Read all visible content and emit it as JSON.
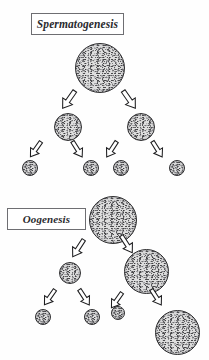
{
  "figure": {
    "title": "",
    "background_color": "#fefefe",
    "width": 209,
    "height": 360
  },
  "panels": [
    {
      "id": "spermatogenesis",
      "label": "Spermatogenesis",
      "label_box": {
        "x": 31,
        "y": 13,
        "w": 93,
        "h": 22,
        "border_color": "#6e6e72"
      },
      "cells": [
        {
          "id": "sperm-primary",
          "name": "primary-spermatocyte",
          "x": 75,
          "y": 43,
          "d": 50,
          "generation": 1
        },
        {
          "id": "sperm-sec-left",
          "name": "secondary-spermatocyte-left",
          "x": 54,
          "y": 113,
          "d": 28,
          "generation": 2
        },
        {
          "id": "sperm-sec-right",
          "name": "secondary-spermatocyte-right",
          "x": 127,
          "y": 113,
          "d": 28,
          "generation": 2
        },
        {
          "id": "sperm-tid-1",
          "name": "spermatid-1",
          "x": 22,
          "y": 160,
          "d": 16,
          "generation": 3
        },
        {
          "id": "sperm-tid-2",
          "name": "spermatid-2",
          "x": 83,
          "y": 160,
          "d": 16,
          "generation": 3
        },
        {
          "id": "sperm-tid-3",
          "name": "spermatid-3",
          "x": 113,
          "y": 160,
          "d": 16,
          "generation": 3
        },
        {
          "id": "sperm-tid-4",
          "name": "spermatid-4",
          "x": 169,
          "y": 160,
          "d": 16,
          "generation": 3
        }
      ],
      "arrows": [
        {
          "id": "sperm-a1",
          "x": 62,
          "y": 89,
          "len": 22,
          "w": 13,
          "angle": 35,
          "from": "sperm-primary",
          "to": "sperm-sec-left"
        },
        {
          "id": "sperm-a2",
          "x": 123,
          "y": 89,
          "len": 22,
          "w": 13,
          "angle": 145,
          "from": "sperm-primary",
          "to": "sperm-sec-right"
        },
        {
          "id": "sperm-a3",
          "x": 30,
          "y": 140,
          "len": 19,
          "w": 11,
          "angle": 35,
          "from": "sperm-sec-left",
          "to": "sperm-tid-1"
        },
        {
          "id": "sperm-a4",
          "x": 72,
          "y": 140,
          "len": 19,
          "w": 11,
          "angle": 148,
          "from": "sperm-sec-left",
          "to": "sperm-tid-2"
        },
        {
          "id": "sperm-a5",
          "x": 106,
          "y": 140,
          "len": 19,
          "w": 11,
          "angle": 33,
          "from": "sperm-sec-right",
          "to": "sperm-tid-3"
        },
        {
          "id": "sperm-a6",
          "x": 152,
          "y": 140,
          "len": 19,
          "w": 11,
          "angle": 148,
          "from": "sperm-sec-right",
          "to": "sperm-tid-4"
        }
      ]
    },
    {
      "id": "oogenesis",
      "label": "Oogenesis",
      "label_box": {
        "x": 7,
        "y": 208,
        "w": 79,
        "h": 22,
        "border_color": "#6e6e72"
      },
      "cells": [
        {
          "id": "oo-primary",
          "name": "primary-oocyte",
          "x": 89,
          "y": 196,
          "d": 48,
          "generation": 1
        },
        {
          "id": "oo-polar-1",
          "name": "first-polar-body",
          "x": 59,
          "y": 262,
          "d": 22,
          "generation": 2
        },
        {
          "id": "oo-secondary",
          "name": "secondary-oocyte",
          "x": 124,
          "y": 249,
          "d": 45,
          "generation": 2
        },
        {
          "id": "oo-polar-1a",
          "name": "polar-body-1a",
          "x": 35,
          "y": 309,
          "d": 16,
          "generation": 3
        },
        {
          "id": "oo-polar-1b",
          "name": "polar-body-1b",
          "x": 84,
          "y": 309,
          "d": 16,
          "generation": 3
        },
        {
          "id": "oo-polar-2",
          "name": "second-polar-body",
          "x": 111,
          "y": 306,
          "d": 14,
          "generation": 3
        },
        {
          "id": "oo-ovum",
          "name": "ovum",
          "x": 155,
          "y": 310,
          "d": 45,
          "generation": 3
        }
      ],
      "arrows": [
        {
          "id": "oo-a1",
          "x": 72,
          "y": 238,
          "len": 21,
          "w": 12,
          "angle": 33,
          "from": "oo-primary",
          "to": "oo-polar-1"
        },
        {
          "id": "oo-a2",
          "x": 121,
          "y": 234,
          "len": 21,
          "w": 12,
          "angle": 147,
          "from": "oo-primary",
          "to": "oo-secondary"
        },
        {
          "id": "oo-a3",
          "x": 44,
          "y": 288,
          "len": 19,
          "w": 11,
          "angle": 35,
          "from": "oo-polar-1",
          "to": "oo-polar-1a"
        },
        {
          "id": "oo-a4",
          "x": 79,
          "y": 288,
          "len": 19,
          "w": 11,
          "angle": 147,
          "from": "oo-polar-1",
          "to": "oo-polar-1b"
        },
        {
          "id": "oo-a5",
          "x": 111,
          "y": 291,
          "len": 19,
          "w": 11,
          "angle": 35,
          "from": "oo-secondary",
          "to": "oo-polar-2"
        },
        {
          "id": "oo-a6",
          "x": 151,
          "y": 288,
          "len": 19,
          "w": 11,
          "angle": 147,
          "from": "oo-secondary",
          "to": "oo-ovum"
        }
      ]
    }
  ],
  "style": {
    "cell_fill": "#dedede",
    "cell_stroke": "#2e2e30",
    "arrow_fill": "#ffffff",
    "arrow_stroke": "#1d1d1f",
    "label_text_color": "#2a2a2e"
  }
}
